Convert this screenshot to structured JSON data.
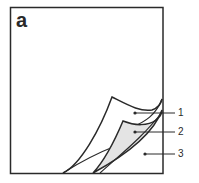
{
  "figure": {
    "panel_label": "a",
    "callouts": [
      {
        "id": 1,
        "label": "1",
        "target": "top curled layer"
      },
      {
        "id": 2,
        "label": "2",
        "target": "middle shaded layer"
      },
      {
        "id": 3,
        "label": "3",
        "target": "base sheet"
      }
    ],
    "colors": {
      "stroke": "#2a2a2a",
      "shaded_layer": "#e4e4e4",
      "background": "#ffffff"
    }
  }
}
